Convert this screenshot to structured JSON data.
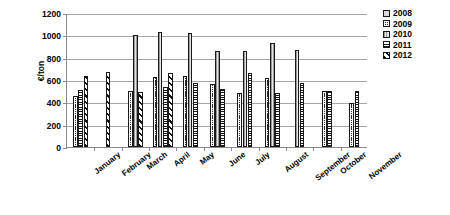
{
  "chart_data": {
    "type": "bar",
    "title": "",
    "xlabel": "",
    "ylabel": "€/ton",
    "ylim": [
      0,
      1200
    ],
    "yticks": [
      0,
      200,
      400,
      600,
      800,
      1000,
      1200
    ],
    "grid": true,
    "legend_position": "right",
    "categories": [
      "January",
      "February",
      "March",
      "April",
      "May",
      "June",
      "July",
      "August",
      "September",
      "October",
      "November"
    ],
    "series": [
      {
        "name": "2008",
        "values": [
          null,
          null,
          null,
          null,
          null,
          null,
          null,
          null,
          null,
          null,
          null
        ]
      },
      {
        "name": "2009",
        "values": [
          460,
          null,
          500,
          630,
          635,
          560,
          480,
          620,
          null,
          500,
          390
        ]
      },
      {
        "name": "2010",
        "values": [
          null,
          null,
          1000,
          1030,
          1025,
          860,
          860,
          930,
          865,
          null,
          null
        ]
      },
      {
        "name": "2011",
        "values": [
          510,
          null,
          null,
          540,
          570,
          520,
          660,
          480,
          575,
          505,
          500
        ]
      },
      {
        "name": "2012",
        "values": [
          640,
          675,
          490,
          660,
          null,
          null,
          null,
          null,
          null,
          null,
          null
        ]
      }
    ]
  },
  "axis": {
    "y_title": "€/ton",
    "y_tick_labels": [
      "0",
      "200",
      "400",
      "600",
      "800",
      "1000",
      "1200"
    ]
  },
  "legend": {
    "items": [
      {
        "label": "2008",
        "pattern": "p-2008"
      },
      {
        "label": "2009",
        "pattern": "p-2009"
      },
      {
        "label": "2010",
        "pattern": "p-2010"
      },
      {
        "label": "2011",
        "pattern": "p-2011"
      },
      {
        "label": "2012",
        "pattern": "p-2012"
      }
    ]
  }
}
